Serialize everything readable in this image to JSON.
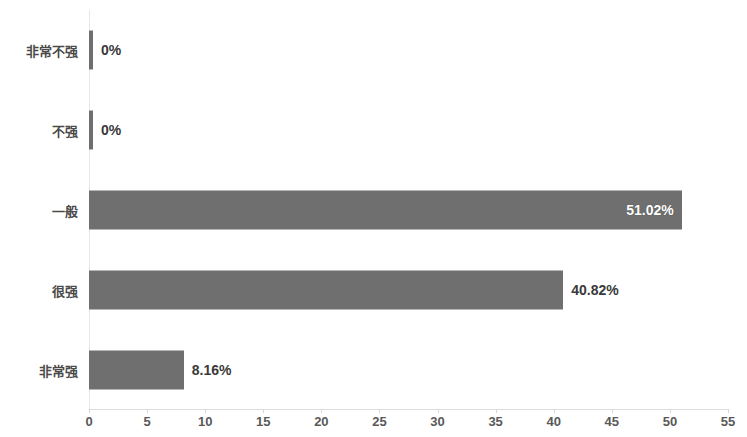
{
  "chart_data": {
    "type": "bar",
    "orientation": "horizontal",
    "title": "",
    "subtitle": "",
    "xlabel": "",
    "ylabel": "",
    "grid": false,
    "legend": null,
    "xlim": [
      0,
      55
    ],
    "xticks": [
      0,
      5,
      10,
      15,
      20,
      25,
      30,
      35,
      40,
      45,
      50,
      55
    ],
    "xtick_labels": [
      "0",
      "5",
      "10",
      "15",
      "20",
      "25",
      "30",
      "35",
      "40",
      "45",
      "50",
      "55"
    ],
    "categories": [
      "非常不强",
      "不强",
      "一般",
      "很强",
      "非常强"
    ],
    "values": [
      0,
      0,
      51.02,
      40.82,
      8.16
    ],
    "data_labels": [
      "0%",
      "0%",
      "51.02%",
      "40.82%",
      "8.16%"
    ],
    "label_placement": [
      "outside",
      "outside",
      "inside",
      "outside",
      "outside"
    ],
    "bar_color": "#6f6f6f",
    "inside_label_color": "#ffffff",
    "outside_label_color": "#3a3a3a",
    "axis_color": "#dcdcdc",
    "tick_label_color": "#595959"
  }
}
